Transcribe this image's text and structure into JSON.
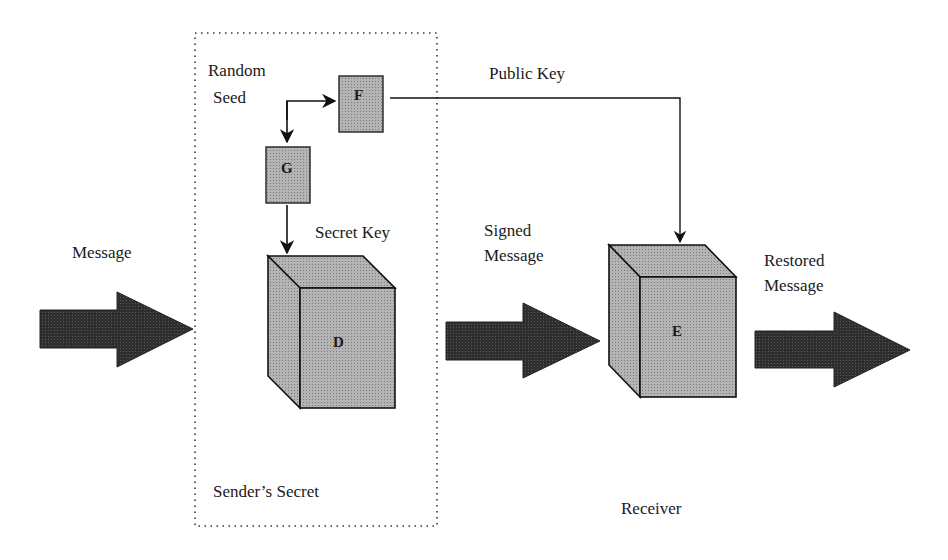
{
  "diagram": {
    "type": "digital-signature-flow",
    "labels": {
      "message": "Message",
      "random_seed_line1": "Random",
      "random_seed_line2": "Seed",
      "public_key": "Public Key",
      "secret_key": "Secret Key",
      "signed_message_line1": "Signed",
      "signed_message_line2": "Message",
      "restored_message_line1": "Restored",
      "restored_message_line2": "Message",
      "senders_secret": "Sender’s Secret",
      "receiver": "Receiver"
    },
    "boxes": {
      "f": "F",
      "g": "G",
      "d": "D",
      "e": "E"
    },
    "colors": {
      "box_fill": "#a8a8a8",
      "arrow_fill": "#2e2e2e",
      "line": "#1a1a1a",
      "dotted_border": "#333333"
    }
  }
}
